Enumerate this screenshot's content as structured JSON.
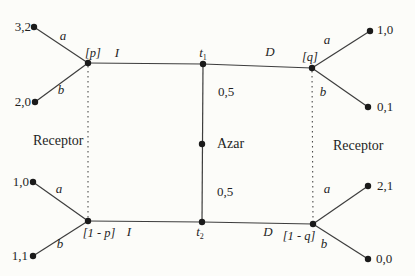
{
  "figure": {
    "type": "signaling-game-tree",
    "colors": {
      "background": "#fcfcf9",
      "line": "#3d3d3d",
      "node": "#1a1a1a",
      "text": "#1f1f1f"
    },
    "chance": {
      "label": "Azar",
      "prob_top": "0,5",
      "prob_bottom": "0,5"
    },
    "types": {
      "top": {
        "base": "t",
        "sub": "1"
      },
      "bottom": {
        "base": "t",
        "sub": "2"
      }
    },
    "receivers": {
      "left": "Receptor",
      "right": "Receptor"
    },
    "beliefs": {
      "top_left": "[p]",
      "top_right": "[q]",
      "bottom_left": "[1 - p]",
      "bottom_right": "[1 - q]"
    },
    "messages": {
      "top_left": "I",
      "top_right": "D",
      "bottom_left": "I",
      "bottom_right": "D"
    },
    "actions": {
      "top_left": {
        "up": "a",
        "down": "b"
      },
      "top_right": {
        "up": "a",
        "down": "b"
      },
      "bottom_left": {
        "up": "a",
        "down": "b"
      },
      "bottom_right": {
        "up": "a",
        "down": "b"
      }
    },
    "payoffs": {
      "top_left": {
        "up": "3,2",
        "down": "2,0"
      },
      "top_right": {
        "up": "1,0",
        "down": "0,1"
      },
      "bottom_left": {
        "up": "1,0",
        "down": "1,1"
      },
      "bottom_right": {
        "up": "2,1",
        "down": "0,0"
      }
    }
  }
}
